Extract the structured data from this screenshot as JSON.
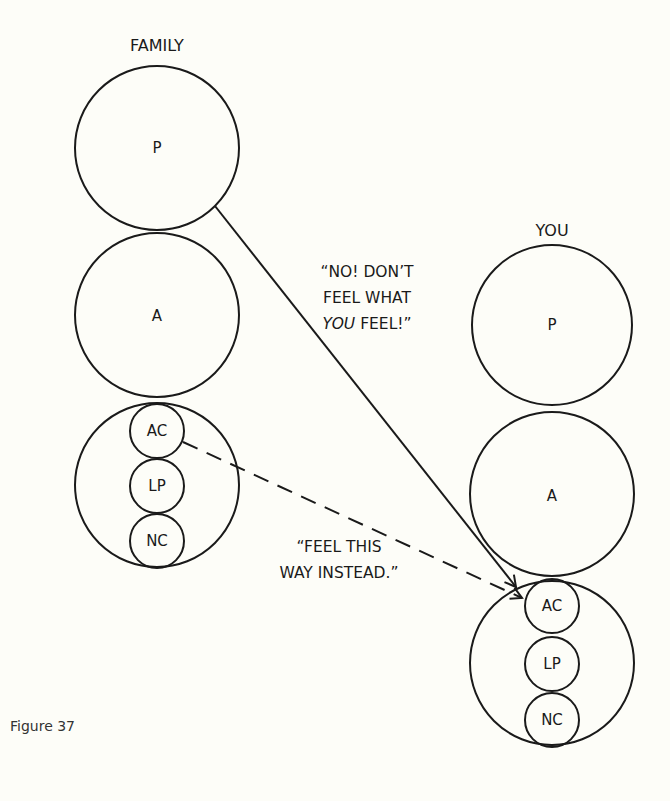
{
  "figure": {
    "caption": "Figure 37"
  },
  "family": {
    "title": "FAMILY",
    "parent_label": "P",
    "adult_label": "A",
    "child": {
      "adapted_child_label": "AC",
      "little_professor_label": "LP",
      "natural_child_label": "NC"
    }
  },
  "you": {
    "title": "YOU",
    "parent_label": "P",
    "adult_label": "A",
    "child": {
      "adapted_child_label": "AC",
      "little_professor_label": "LP",
      "natural_child_label": "NC"
    }
  },
  "messages": {
    "solid_arrow": {
      "from": "FAMILY P",
      "to": "YOU AC",
      "style": "solid",
      "line1": "“NO! DON’T",
      "line2": "FEEL WHAT",
      "line3_italic": "YOU",
      "line3_rest": " FEEL!”"
    },
    "dashed_arrow": {
      "from": "FAMILY AC",
      "to": "YOU AC",
      "style": "dashed",
      "line1": "“FEEL THIS",
      "line2": "WAY INSTEAD.”"
    }
  },
  "colors": {
    "ink": "#1a1a1a",
    "paper": "#fdfdf8"
  }
}
